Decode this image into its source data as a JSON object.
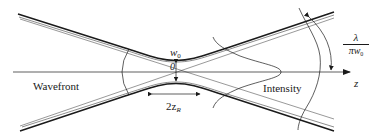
{
  "diagram": {
    "labels": {
      "wavefront": "Wavefront",
      "intensity": "Intensity",
      "axis_z": "z",
      "origin": "0",
      "waist_w": "w",
      "waist_sub": "0",
      "rayleigh_prefix": "2z",
      "rayleigh_sub": "R",
      "divergence_num": "λ",
      "divergence_den_main": "πw",
      "divergence_den_sub": "0"
    },
    "colors": {
      "stroke": "#1a1a1a",
      "background": "#ffffff"
    }
  }
}
